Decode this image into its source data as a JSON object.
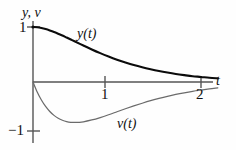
{
  "figure": {
    "background_color": "#fefefe",
    "axis_color": "#555555",
    "text_color": "#111111"
  },
  "axes": {
    "vertical_label": "y, v",
    "horizontal_label": "t",
    "y_ticks": [
      {
        "value": 1,
        "label": "1"
      },
      {
        "value": -1,
        "label": "−1"
      }
    ],
    "x_ticks": [
      {
        "value": 1,
        "label": "1"
      },
      {
        "value": 2,
        "label": "2"
      }
    ]
  },
  "curves": {
    "y": {
      "label": "y(t)",
      "color": "#0b0b0b",
      "width": 2.1
    },
    "v": {
      "label": "v(t)",
      "color": "#6b6b6b",
      "width": 1.25
    }
  },
  "chart_data": {
    "type": "line",
    "title": "",
    "xlabel": "t",
    "ylabel": "y, v",
    "xlim": [
      0,
      2.25
    ],
    "ylim": [
      -1.15,
      1.15
    ],
    "grid": false,
    "legend": "inline-curve-labels",
    "xticks": [
      1,
      2
    ],
    "xticklabels": [
      "1",
      "2"
    ],
    "yticks": [
      1,
      -1
    ],
    "yticklabels": [
      "1",
      "−1"
    ],
    "annotations": [
      {
        "text": "y(t)",
        "x": 0.52,
        "y": 0.92
      },
      {
        "text": "v(t)",
        "x": 0.98,
        "y": -0.7
      }
    ],
    "x": [
      0,
      0.05,
      0.1,
      0.15,
      0.2,
      0.25,
      0.3,
      0.35,
      0.4,
      0.45,
      0.5,
      0.6,
      0.7,
      0.8,
      0.9,
      1.0,
      1.1,
      1.2,
      1.3,
      1.4,
      1.5,
      1.6,
      1.7,
      1.8,
      1.9,
      2.0,
      2.1,
      2.2
    ],
    "series": [
      {
        "name": "y(t)",
        "formula": "(1 + 2t) e^(-2t)",
        "values": [
          1.0,
          0.995,
          0.982,
          0.963,
          0.938,
          0.91,
          0.878,
          0.845,
          0.809,
          0.772,
          0.736,
          0.663,
          0.592,
          0.525,
          0.463,
          0.406,
          0.355,
          0.308,
          0.267,
          0.231,
          0.199,
          0.171,
          0.146,
          0.125,
          0.106,
          0.092,
          0.077,
          0.066
        ]
      },
      {
        "name": "v(t)",
        "formula": "-4t e^(-2t)",
        "values": [
          0.0,
          -0.181,
          -0.327,
          -0.444,
          -0.536,
          -0.607,
          -0.659,
          -0.695,
          -0.719,
          -0.732,
          -0.736,
          -0.723,
          -0.69,
          -0.646,
          -0.595,
          -0.541,
          -0.487,
          -0.435,
          -0.386,
          -0.34,
          -0.299,
          -0.261,
          -0.227,
          -0.197,
          -0.17,
          -0.147,
          -0.126,
          -0.108
        ]
      }
    ]
  }
}
